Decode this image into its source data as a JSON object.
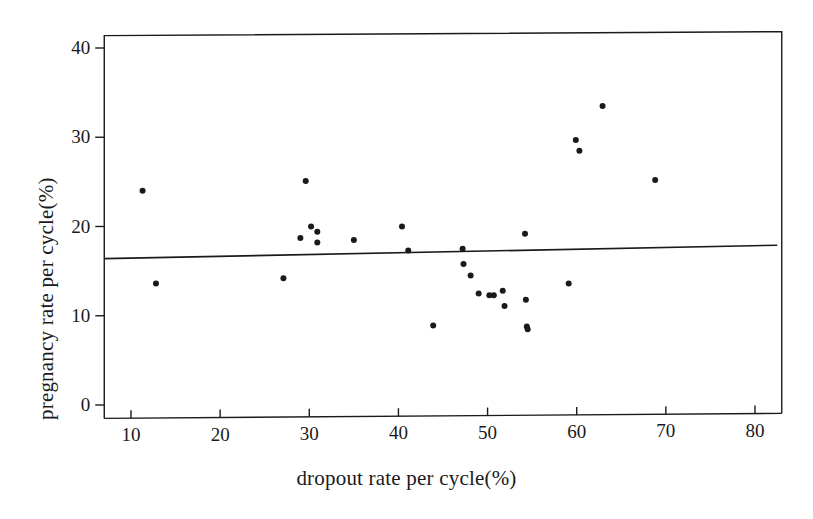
{
  "figure": {
    "background_color": "#ffffff",
    "ink_color": "#1a1a1a"
  },
  "chart_data": {
    "type": "scatter",
    "title": "",
    "xlabel": "dropout rate per cycle(%)",
    "ylabel": "pregnancy rate per cycle(%)",
    "xlim": [
      7.0,
      83.0
    ],
    "ylim": [
      -1.5,
      41.5
    ],
    "xticks": [
      10,
      20,
      30,
      40,
      50,
      60,
      70,
      80
    ],
    "xtick_labels": [
      "10",
      "20",
      "30",
      "40",
      "50",
      "60",
      "70",
      "80"
    ],
    "yticks": [
      0,
      10,
      20,
      30,
      40
    ],
    "ytick_labels": [
      "0",
      "10",
      "20",
      "30",
      "40"
    ],
    "grid": false,
    "legend": null,
    "marker": {
      "shape": "circle",
      "color": "#1a1a1a",
      "size_px": 6
    },
    "points": [
      {
        "x": 11.3,
        "y": 24.0
      },
      {
        "x": 12.8,
        "y": 13.6
      },
      {
        "x": 27.1,
        "y": 14.2
      },
      {
        "x": 29.0,
        "y": 18.7
      },
      {
        "x": 29.6,
        "y": 25.1
      },
      {
        "x": 30.2,
        "y": 20.0
      },
      {
        "x": 30.9,
        "y": 19.4
      },
      {
        "x": 30.9,
        "y": 18.2
      },
      {
        "x": 35.0,
        "y": 18.5
      },
      {
        "x": 40.4,
        "y": 20.0
      },
      {
        "x": 41.1,
        "y": 17.3
      },
      {
        "x": 43.9,
        "y": 8.9
      },
      {
        "x": 47.2,
        "y": 17.5
      },
      {
        "x": 47.3,
        "y": 15.8
      },
      {
        "x": 48.1,
        "y": 14.5
      },
      {
        "x": 49.0,
        "y": 12.5
      },
      {
        "x": 50.2,
        "y": 12.3
      },
      {
        "x": 50.7,
        "y": 12.3
      },
      {
        "x": 51.7,
        "y": 12.8
      },
      {
        "x": 51.9,
        "y": 11.1
      },
      {
        "x": 54.2,
        "y": 19.2
      },
      {
        "x": 54.3,
        "y": 11.8
      },
      {
        "x": 54.4,
        "y": 8.8
      },
      {
        "x": 54.5,
        "y": 8.5
      },
      {
        "x": 59.1,
        "y": 13.6
      },
      {
        "x": 59.9,
        "y": 29.7
      },
      {
        "x": 60.3,
        "y": 28.5
      },
      {
        "x": 62.9,
        "y": 33.5
      },
      {
        "x": 68.8,
        "y": 25.2
      }
    ],
    "trend_line": {
      "type": "linear-fit",
      "color": "#1a1a1a",
      "x_start": 7.0,
      "y_start": 16.4,
      "x_end": 82.5,
      "y_end": 17.9
    }
  }
}
